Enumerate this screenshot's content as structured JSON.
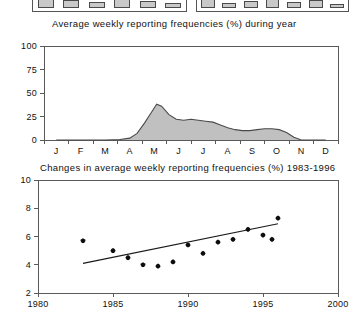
{
  "top_panels": {
    "left": {
      "name": "cropped-bar-panel-left",
      "bars": [
        42,
        30,
        22,
        34,
        26,
        18
      ]
    },
    "right": {
      "name": "cropped-bar-panel-right",
      "bars": [
        36,
        20,
        26,
        40,
        24,
        30,
        16
      ]
    }
  },
  "chart_data": [
    {
      "id": "seasonal-chart",
      "type": "area",
      "title": "Average weekly reporting frequencies (%) during year",
      "xlabel": "",
      "ylabel": "",
      "categories": [
        "J",
        "F",
        "M",
        "A",
        "M",
        "J",
        "J",
        "A",
        "S",
        "O",
        "N",
        "D"
      ],
      "ytick_labels": [
        "0",
        "25",
        "50",
        "75",
        "100"
      ],
      "ytick_values": [
        0,
        25,
        50,
        75,
        100
      ],
      "ylim": [
        0,
        100
      ],
      "grid": false,
      "legend": "none",
      "x": [
        1.0,
        2.0,
        3.0,
        3.6,
        4.0,
        4.3,
        4.6,
        4.9,
        5.1,
        5.3,
        5.6,
        5.9,
        6.2,
        6.5,
        6.8,
        7.1,
        7.4,
        7.7,
        8.0,
        8.3,
        8.6,
        8.9,
        9.2,
        9.5,
        9.8,
        10.1,
        10.4,
        10.7,
        11.0,
        12.0
      ],
      "values": [
        0,
        0,
        0,
        0.5,
        2,
        7,
        18,
        30,
        38,
        36,
        27,
        22,
        21,
        22,
        21,
        20,
        19,
        16,
        13,
        11,
        10,
        10,
        11,
        12,
        12,
        11,
        8,
        3,
        0,
        0
      ]
    },
    {
      "id": "trend-chart",
      "type": "scatter",
      "title": "Changes in average weekly reporting frequencies (%) 1983-1996",
      "xlabel": "",
      "ylabel": "",
      "xtick_labels": [
        "1980",
        "1985",
        "1990",
        "1995",
        "2000"
      ],
      "xtick_values": [
        1980,
        1985,
        1990,
        1995,
        2000
      ],
      "ytick_labels": [
        "2",
        "4",
        "6",
        "8",
        "10"
      ],
      "ytick_values": [
        2,
        4,
        6,
        8,
        10
      ],
      "xlim": [
        1980,
        2000
      ],
      "ylim": [
        2,
        10
      ],
      "grid": false,
      "legend": "none",
      "points": [
        {
          "x": 1983,
          "y": 5.7
        },
        {
          "x": 1985,
          "y": 5.0
        },
        {
          "x": 1986,
          "y": 4.5
        },
        {
          "x": 1987,
          "y": 4.0
        },
        {
          "x": 1988,
          "y": 3.9
        },
        {
          "x": 1989,
          "y": 4.2
        },
        {
          "x": 1990,
          "y": 5.4
        },
        {
          "x": 1991,
          "y": 4.8
        },
        {
          "x": 1992,
          "y": 5.6
        },
        {
          "x": 1993,
          "y": 5.8
        },
        {
          "x": 1994,
          "y": 6.5
        },
        {
          "x": 1995,
          "y": 6.1
        },
        {
          "x": 1995.6,
          "y": 5.8
        },
        {
          "x": 1996,
          "y": 7.3
        }
      ],
      "trend": {
        "x0": 1983,
        "y0": 4.1,
        "x1": 1996,
        "y1": 6.9
      }
    }
  ]
}
